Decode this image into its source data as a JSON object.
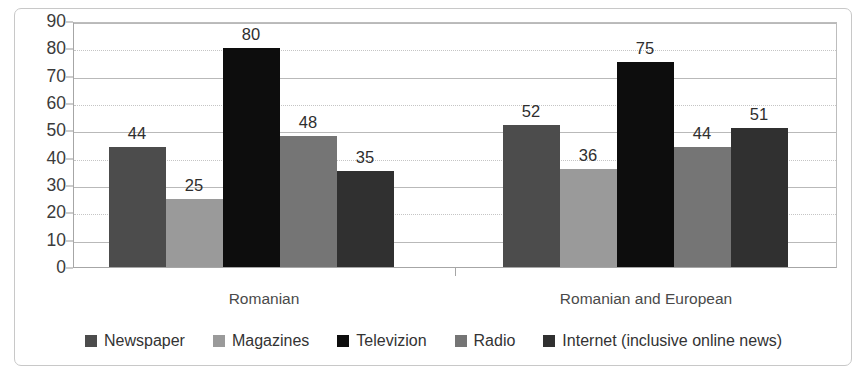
{
  "chart_data": {
    "type": "bar",
    "title": "",
    "subtitle": "",
    "xlabel": "",
    "ylabel": "",
    "ylim": [
      0,
      90
    ],
    "ytick_step": 10,
    "yticks": [
      0,
      10,
      20,
      30,
      40,
      50,
      60,
      70,
      80,
      90
    ],
    "ytick_labels": [
      "0",
      "10",
      "20",
      "30",
      "40",
      "50",
      "60",
      "70",
      "80",
      "90"
    ],
    "grid": true,
    "legend_position": "bottom",
    "categories": [
      "Romanian",
      "Romanian and European"
    ],
    "series": [
      {
        "name": "Newspaper",
        "color": "#4c4c4c",
        "values": [
          44,
          52
        ],
        "value_labels": [
          "44",
          "52"
        ]
      },
      {
        "name": "Magazines",
        "color": "#9a9a9a",
        "values": [
          25,
          36
        ],
        "value_labels": [
          "25",
          "36"
        ]
      },
      {
        "name": "Televizion",
        "color": "#0d0d0d",
        "values": [
          80,
          75
        ],
        "value_labels": [
          "80",
          "75"
        ]
      },
      {
        "name": "Radio",
        "color": "#757575",
        "values": [
          48,
          44
        ],
        "value_labels": [
          "48",
          "44"
        ]
      },
      {
        "name": "Internet (inclusive online news)",
        "color": "#303030",
        "values": [
          35,
          51
        ],
        "value_labels": [
          "35",
          "51"
        ]
      }
    ]
  },
  "legend": {
    "items": [
      {
        "label": "Newspaper",
        "color": "#4c4c4c"
      },
      {
        "label": "Magazines",
        "color": "#9a9a9a"
      },
      {
        "label": "Televizion",
        "color": "#0d0d0d"
      },
      {
        "label": "Radio",
        "color": "#757575"
      },
      {
        "label": "Internet (inclusive online news)",
        "color": "#303030"
      }
    ]
  },
  "colors": {
    "background": "#ffffff",
    "frame": "#c8c8c8",
    "axis": "#a6a6a6",
    "gridline": "#b9b9b9",
    "label_text": "#2e2e2e",
    "tick_text": "#3b3b3b"
  }
}
